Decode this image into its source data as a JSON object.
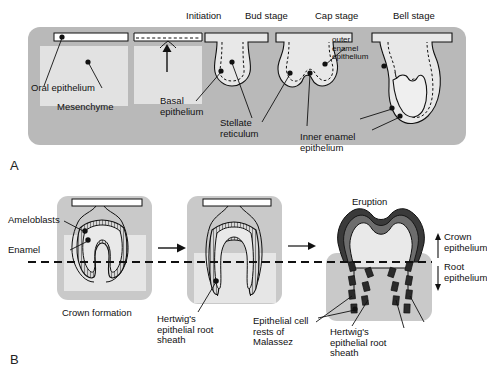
{
  "figure": {
    "panels": [
      {
        "id": "A",
        "letter": "A",
        "stage_titles": [
          {
            "key": "initiation",
            "label": "Initiation"
          },
          {
            "key": "bud",
            "label": "Bud stage"
          },
          {
            "key": "cap",
            "label": "Cap stage"
          },
          {
            "key": "bell",
            "label": "Bell stage"
          }
        ],
        "labels": [
          {
            "key": "oral_epithelium",
            "label": "Oral epithelium"
          },
          {
            "key": "mesenchyme",
            "label": "Mesenchyme"
          },
          {
            "key": "basal_epithelium",
            "label": "Basal\nepithelium"
          },
          {
            "key": "stellate_reticulum",
            "label": "Stellate\nreticulum"
          },
          {
            "key": "outer_enamel_epithelium",
            "label": "outer\nenamel\nepithelium"
          },
          {
            "key": "inner_enamel_epithelium",
            "label": "Inner enamel\nepithelium"
          }
        ]
      },
      {
        "id": "B",
        "letter": "B",
        "stage_titles": [
          {
            "key": "eruption",
            "label": "Eruption"
          }
        ],
        "labels": [
          {
            "key": "ameloblasts",
            "label": "Ameloblasts"
          },
          {
            "key": "enamel",
            "label": "Enamel"
          },
          {
            "key": "crown_formation",
            "label": "Crown formation"
          },
          {
            "key": "hertwigs_sheath_mid",
            "label": "Hertwig's\nepithelial root\nsheath"
          },
          {
            "key": "epithelial_cell_rests",
            "label": "Epithelial cell\nrests of\nMalassez"
          },
          {
            "key": "hertwigs_sheath_right",
            "label": "Hertwig's\nepithelial root\nsheath"
          },
          {
            "key": "crown_epithelium",
            "label": "Crown\nepithelium"
          },
          {
            "key": "root_epithelium",
            "label": "Root\nepithelium"
          }
        ]
      }
    ],
    "colors": {
      "mesenchyme_band": "#b9b9b9",
      "tissue_light": "#e2e2e2",
      "tooth_fill": "#e8e8e8",
      "enamel_dark": "#3a3a3a",
      "enamel_mid": "#6d6d6d",
      "outline": "#111111",
      "background": "#ffffff"
    }
  }
}
